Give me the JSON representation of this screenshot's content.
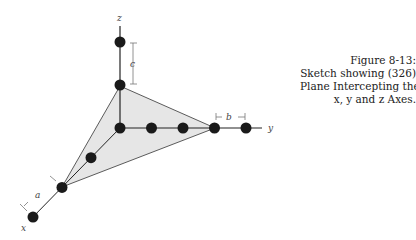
{
  "figure": {
    "caption_lines": [
      "Figure 8-13:",
      "Sketch showing (326)",
      "Plane Intercepting the",
      "x, y and z Axes."
    ],
    "axes": {
      "x": "x",
      "y": "y",
      "z": "z"
    },
    "intercept_labels": {
      "a": "a",
      "b": "b",
      "c": "c"
    },
    "lattice_points": {
      "x_axis_count": 3,
      "y_axis_count": 4,
      "z_axis_count": 2
    },
    "plane_intercepts": {
      "x": 2,
      "y": 3,
      "z": 1
    },
    "colors": {
      "plane_fill": "#e6e6e6",
      "ink": "#222222",
      "dot": "#1a1a1a"
    }
  }
}
